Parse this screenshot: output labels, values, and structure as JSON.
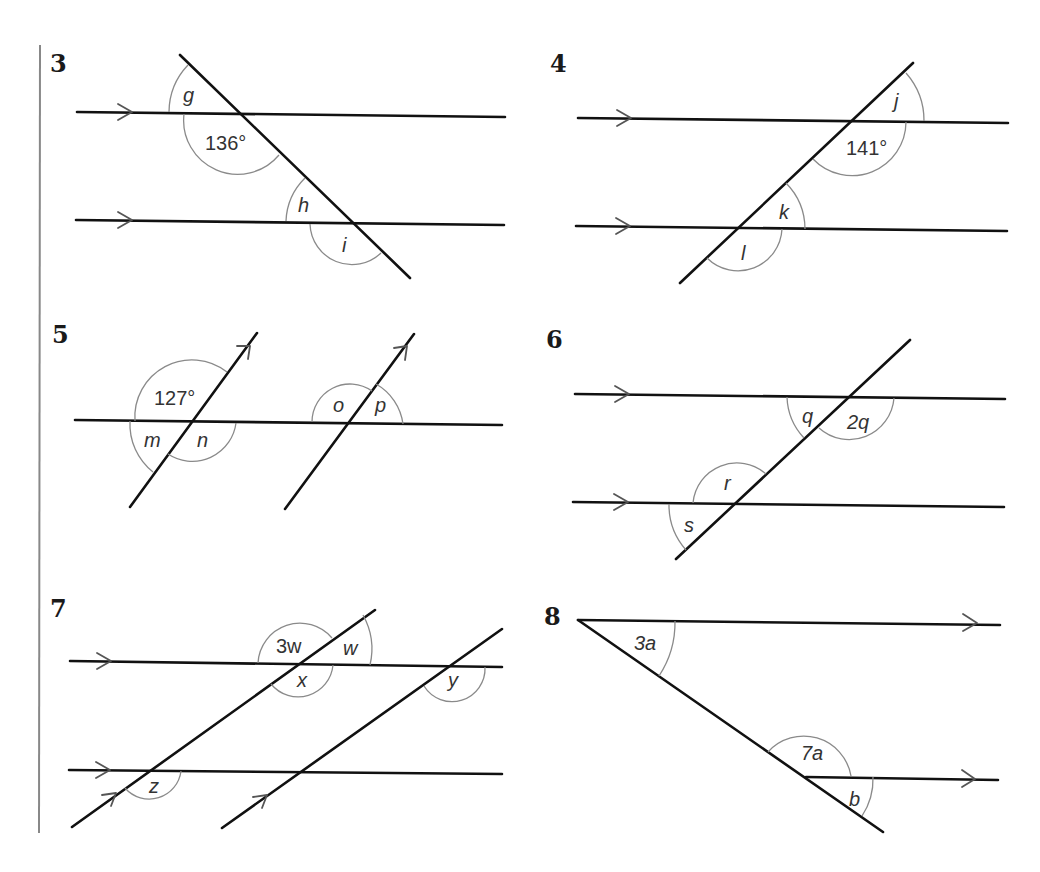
{
  "page": {
    "margin_bar_color": "#888888",
    "line_color": "#111111",
    "arc_color": "#8a8a8a"
  },
  "questions": [
    {
      "number": "3",
      "labels": {
        "g": "g",
        "given": "136°",
        "h": "h",
        "i": "i"
      },
      "given_angle": 136,
      "unknowns": [
        "g",
        "h",
        "i"
      ]
    },
    {
      "number": "4",
      "labels": {
        "j": "j",
        "given": "141°",
        "k": "k",
        "l": "l"
      },
      "given_angle": 141,
      "unknowns": [
        "j",
        "k",
        "l"
      ]
    },
    {
      "number": "5",
      "labels": {
        "given": "127°",
        "m": "m",
        "n": "n",
        "o": "o",
        "p": "p"
      },
      "given_angle": 127,
      "unknowns": [
        "m",
        "n",
        "o",
        "p"
      ]
    },
    {
      "number": "6",
      "labels": {
        "q": "q",
        "q2": "2q",
        "r": "r",
        "s": "s"
      },
      "unknowns": [
        "q",
        "r",
        "s"
      ]
    },
    {
      "number": "7",
      "labels": {
        "w3": "3w",
        "w": "w",
        "x": "x",
        "y": "y",
        "z": "z"
      },
      "unknowns": [
        "w",
        "x",
        "y",
        "z"
      ]
    },
    {
      "number": "8",
      "labels": {
        "a3": "3a",
        "a7": "7a",
        "b": "b"
      },
      "unknowns": [
        "a",
        "b"
      ]
    }
  ]
}
